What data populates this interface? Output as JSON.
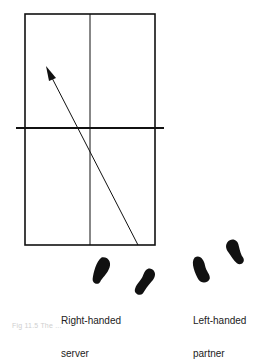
{
  "figure": {
    "labels": {
      "server": [
        "Right-handed",
        "server"
      ],
      "partner": [
        "Left-handed",
        "partner"
      ]
    },
    "caption": "Fig 11.5  The ...",
    "court": {
      "left": 25,
      "top": 14,
      "right": 155,
      "bottom": 245,
      "center_x": 90,
      "net_y": 128,
      "net_left": 16,
      "net_right": 164
    },
    "arrow": {
      "from": [
        138,
        245
      ],
      "to": [
        46,
        66
      ]
    },
    "footprints": {
      "server": [
        {
          "cx": 102,
          "cy": 271,
          "rot": 15
        },
        {
          "cx": 146,
          "cy": 282,
          "rot": 20
        }
      ],
      "partner": [
        {
          "cx": 201,
          "cy": 269,
          "rot": -20
        },
        {
          "cx": 235,
          "cy": 252,
          "rot": -25
        }
      ]
    },
    "colors": {
      "ink": "#111111",
      "caption": "#cfcfcf"
    }
  }
}
